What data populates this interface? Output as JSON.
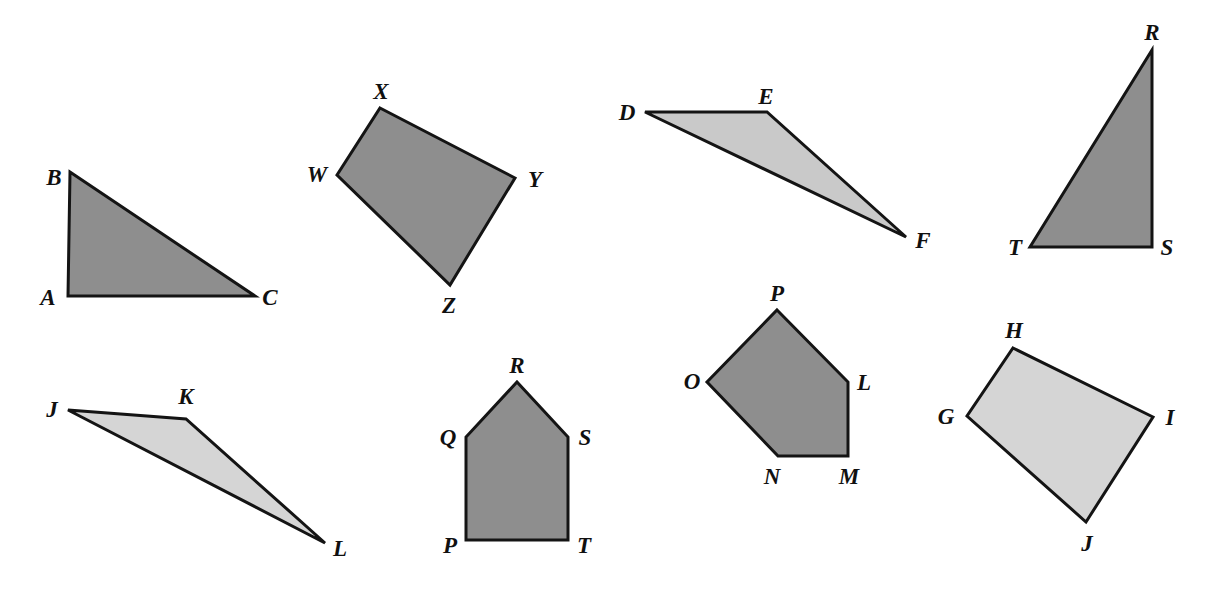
{
  "page": {
    "width": 1214,
    "height": 592,
    "background_color": "#ffffff"
  },
  "styles": {
    "fill_dark": "#8e8e8e",
    "fill_light": "#c9c9c9",
    "stroke": "#141414",
    "stroke_width": 3,
    "label_color": "#101010"
  },
  "figures": [
    {
      "id": "triangle-abc",
      "name": "triangle-abc",
      "shape_type": "triangle",
      "sides": 3,
      "fill": "#8e8e8e",
      "points": "70,172 255,296 68,296",
      "vertices": [
        {
          "label": "A",
          "x": 68,
          "y": 296,
          "label_x": 48,
          "label_y": 297
        },
        {
          "label": "B",
          "x": 70,
          "y": 172,
          "label_x": 54,
          "label_y": 177
        },
        {
          "label": "C",
          "x": 255,
          "y": 296,
          "label_x": 270,
          "label_y": 297
        }
      ]
    },
    {
      "id": "quadrilateral-wxyz",
      "name": "quadrilateral-wxyz",
      "shape_type": "quadrilateral",
      "sides": 4,
      "fill": "#8e8e8e",
      "points": "380,108 515,178 450,285 337,175",
      "vertices": [
        {
          "label": "W",
          "x": 337,
          "y": 175,
          "label_x": 317,
          "label_y": 174
        },
        {
          "label": "X",
          "x": 380,
          "y": 108,
          "label_x": 381,
          "label_y": 91
        },
        {
          "label": "Y",
          "x": 515,
          "y": 178,
          "label_x": 535,
          "label_y": 179
        },
        {
          "label": "Z",
          "x": 450,
          "y": 285,
          "label_x": 449,
          "label_y": 305
        }
      ]
    },
    {
      "id": "triangle-def",
      "name": "triangle-def",
      "shape_type": "triangle",
      "sides": 3,
      "fill": "#c9c9c9",
      "points": "645,112 767,112 906,237",
      "vertices": [
        {
          "label": "D",
          "x": 645,
          "y": 112,
          "label_x": 627,
          "label_y": 112
        },
        {
          "label": "E",
          "x": 767,
          "y": 112,
          "label_x": 766,
          "label_y": 96
        },
        {
          "label": "F",
          "x": 906,
          "y": 237,
          "label_x": 923,
          "label_y": 240
        }
      ]
    },
    {
      "id": "triangle-rst",
      "name": "triangle-rst",
      "shape_type": "triangle",
      "sides": 3,
      "fill": "#8e8e8e",
      "points": "1152,50 1152,247 1030,247",
      "vertices": [
        {
          "label": "R",
          "x": 1152,
          "y": 50,
          "label_x": 1152,
          "label_y": 32
        },
        {
          "label": "S",
          "x": 1152,
          "y": 247,
          "label_x": 1167,
          "label_y": 247
        },
        {
          "label": "T",
          "x": 1030,
          "y": 247,
          "label_x": 1015,
          "label_y": 247
        }
      ]
    },
    {
      "id": "triangle-jkl",
      "name": "triangle-jkl",
      "shape_type": "triangle",
      "sides": 3,
      "fill": "#d5d5d5",
      "points": "68,410 186,419 325,543",
      "vertices": [
        {
          "label": "J",
          "x": 68,
          "y": 410,
          "label_x": 52,
          "label_y": 409
        },
        {
          "label": "K",
          "x": 186,
          "y": 419,
          "label_x": 186,
          "label_y": 396
        },
        {
          "label": "L",
          "x": 325,
          "y": 543,
          "label_x": 340,
          "label_y": 548
        }
      ]
    },
    {
      "id": "pentagon-pqrst",
      "name": "pentagon-pqrst",
      "shape_type": "pentagon",
      "sides": 5,
      "fill": "#8e8e8e",
      "points": "517,382 568,437 568,540 466,540 466,437",
      "vertices": [
        {
          "label": "P",
          "x": 466,
          "y": 540,
          "label_x": 450,
          "label_y": 545
        },
        {
          "label": "Q",
          "x": 466,
          "y": 437,
          "label_x": 448,
          "label_y": 437
        },
        {
          "label": "R",
          "x": 517,
          "y": 382,
          "label_x": 517,
          "label_y": 365
        },
        {
          "label": "S",
          "x": 568,
          "y": 437,
          "label_x": 585,
          "label_y": 437
        },
        {
          "label": "T",
          "x": 568,
          "y": 540,
          "label_x": 584,
          "label_y": 545
        }
      ]
    },
    {
      "id": "pentagon-lmnop",
      "name": "pentagon-lmnop",
      "shape_type": "pentagon",
      "sides": 5,
      "fill": "#8e8e8e",
      "points": "777,310 848,382 848,456 778,456 707,382",
      "vertices": [
        {
          "label": "L",
          "x": 848,
          "y": 382,
          "label_x": 864,
          "label_y": 382
        },
        {
          "label": "M",
          "x": 848,
          "y": 456,
          "label_x": 849,
          "label_y": 476
        },
        {
          "label": "N",
          "x": 778,
          "y": 456,
          "label_x": 772,
          "label_y": 476
        },
        {
          "label": "O",
          "x": 707,
          "y": 382,
          "label_x": 692,
          "label_y": 381
        },
        {
          "label": "P",
          "x": 777,
          "y": 310,
          "label_x": 777,
          "label_y": 293
        }
      ]
    },
    {
      "id": "quadrilateral-ghij",
      "name": "quadrilateral-ghij",
      "shape_type": "quadrilateral",
      "sides": 4,
      "fill": "#d5d5d5",
      "points": "1013,348 1153,417 1086,522 967,416",
      "vertices": [
        {
          "label": "G",
          "x": 967,
          "y": 416,
          "label_x": 946,
          "label_y": 416
        },
        {
          "label": "H",
          "x": 1013,
          "y": 348,
          "label_x": 1014,
          "label_y": 330
        },
        {
          "label": "I",
          "x": 1153,
          "y": 417,
          "label_x": 1170,
          "label_y": 417
        },
        {
          "label": "J",
          "x": 1086,
          "y": 522,
          "label_x": 1087,
          "label_y": 543
        }
      ]
    }
  ]
}
